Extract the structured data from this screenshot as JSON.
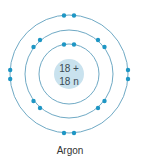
{
  "atom": {
    "name": "Argon",
    "nucleus": {
      "protons_label": "18 +",
      "neutrons_label": "18 n"
    },
    "shells": [
      {
        "radius": 30,
        "electrons": 2
      },
      {
        "radius": 44,
        "electrons": 8
      },
      {
        "radius": 59,
        "electrons": 8
      }
    ]
  },
  "colors": {
    "orbit": "#5f9fbd",
    "electron": "#1e96c4",
    "nucleus_fill": "#c9e2ee",
    "nucleus_text": "#3a4a55",
    "caption": "#333333"
  }
}
